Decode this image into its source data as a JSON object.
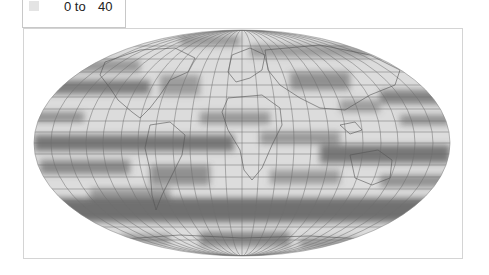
{
  "legend": {
    "items": [
      {
        "swatch_color": "#e4e4e4",
        "from_label": "0 to",
        "to_label": "40"
      }
    ]
  },
  "map": {
    "projection": "mollweide",
    "base_color": "#dcdcdc",
    "band_color": "#5a5a5a",
    "graticule_color": "#6e6e6e",
    "border_color": "#555555",
    "frame_border_color": "#d4d4d4"
  }
}
